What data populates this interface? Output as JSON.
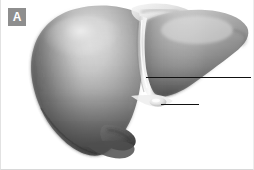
{
  "figure": {
    "panel_label": "A",
    "style": "grayscale-airbrush-anatomical-illustration",
    "width": 254,
    "height": 170
  },
  "badge": {
    "letter": "A",
    "background_color": "#8e8e8e",
    "text_color": "#ffffff"
  },
  "colors": {
    "background": "#ffffff",
    "organ_light": "#d9d9d9",
    "organ_mid": "#9a9a9a",
    "organ_dark": "#5a5a5a",
    "organ_deepest": "#3b3b3b",
    "highlight": "#f2f2f2",
    "leader_line": "#111111",
    "border": "#e2e2e2"
  },
  "structures": [
    {
      "name": "right-lobe",
      "note": "large dome-shaped lobe occupying the left two-thirds of the figure"
    },
    {
      "name": "left-lobe",
      "note": "smaller tapering lobe on the right, ending in a point at the right margin"
    },
    {
      "name": "falciform-ligament",
      "note": "pale vertical groove dividing the two lobes"
    },
    {
      "name": "gallbladder-fundus",
      "note": "small rounded protrusion at the inferior border"
    },
    {
      "name": "inferior-border",
      "note": "sharp lower margin of the right lobe"
    }
  ],
  "leader_lines": [
    {
      "name": "falciform-ligament-pointer",
      "label": "",
      "x1": 145,
      "y1": 77,
      "x2": 250,
      "y2": 77
    },
    {
      "name": "gallbladder-pointer",
      "label": "",
      "x1": 160,
      "y1": 104,
      "x2": 198,
      "y2": 104
    }
  ]
}
